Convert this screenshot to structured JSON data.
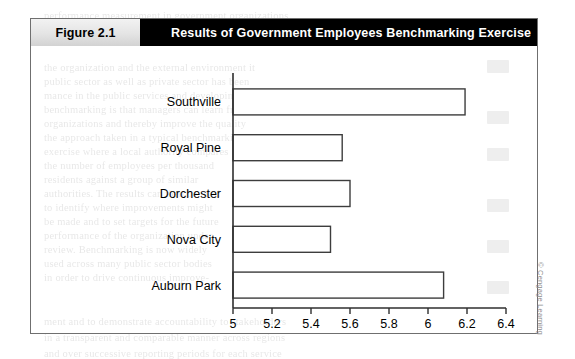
{
  "figure": {
    "number_label": "Figure 2.1",
    "title": "Results of Government Employees Benchmarking Exercise",
    "credit": "© Cengage Learning"
  },
  "chart_data": {
    "type": "bar",
    "orientation": "horizontal",
    "title": "Results of Government Employees Benchmarking Exercise",
    "xlabel": "Government Employees per 1,000 Residents",
    "ylabel": "",
    "categories": [
      "Southville",
      "Royal Pine",
      "Dorchester",
      "Nova City",
      "Auburn Park"
    ],
    "values": [
      6.19,
      5.56,
      5.6,
      5.5,
      6.08
    ],
    "xlim": [
      5,
      6.4
    ],
    "xticks": [
      5,
      5.2,
      5.4,
      5.6,
      5.8,
      6,
      6.2,
      6.4
    ],
    "xticklabels": [
      "5",
      "5.2",
      "5.4",
      "5.6",
      "5.8",
      "6",
      "6.2",
      "6.4"
    ],
    "grid": false,
    "legend": null,
    "bar_fill": "#ffffff",
    "bar_edge": "#3d3d3d"
  },
  "bleed_text": {
    "lines": [
      {
        "x": 44,
        "y": 62,
        "t": "the organization and the external environment it"
      },
      {
        "x": 44,
        "y": 76,
        "t": "public sector as well as private sector has been"
      },
      {
        "x": 44,
        "y": 90,
        "t": "mance  in  the  public  services  and  developing"
      },
      {
        "x": 44,
        "y": 104,
        "t": "benchmarking is that managers can learn from"
      },
      {
        "x": 44,
        "y": 118,
        "t": "organizations and thereby improve the quality"
      },
      {
        "x": 44,
        "y": 132,
        "t": "the  approach  taken  in  a  typical  benchmarking"
      },
      {
        "x": 44,
        "y": 146,
        "t": "exercise where a local authority compares"
      },
      {
        "x": 44,
        "y": 160,
        "t": "the  number  of  employees  per  thousand"
      },
      {
        "x": 44,
        "y": 174,
        "t": "residents  against  a  group  of  similar"
      },
      {
        "x": 44,
        "y": 188,
        "t": "authorities. The results can then be used"
      },
      {
        "x": 44,
        "y": 202,
        "t": "to  identify  where  improvements  might"
      },
      {
        "x": 44,
        "y": 216,
        "t": "be made and to set targets for the future"
      },
      {
        "x": 44,
        "y": 230,
        "t": "performance of the organization under"
      },
      {
        "x": 44,
        "y": 244,
        "t": "review.  Benchmarking  is  now  widely"
      },
      {
        "x": 44,
        "y": 258,
        "t": "used across many public sector bodies"
      },
      {
        "x": 44,
        "y": 272,
        "t": "in order to drive continuous improve-"
      },
      {
        "x": 44,
        "y": 316,
        "t": "ment and to demonstrate accountability to stakeholders"
      },
      {
        "x": 44,
        "y": 332,
        "t": "in a transparent and comparable manner across regions"
      },
      {
        "x": 44,
        "y": 348,
        "t": "and over successive reporting periods for each service"
      },
      {
        "x": 44,
        "y": 10,
        "t": "performance measurement in government organizations"
      }
    ],
    "boxes": [
      {
        "x": 487,
        "y": 60
      },
      {
        "x": 487,
        "y": 111
      },
      {
        "x": 487,
        "y": 148
      },
      {
        "x": 487,
        "y": 199
      },
      {
        "x": 487,
        "y": 240
      },
      {
        "x": 487,
        "y": 281
      }
    ]
  }
}
